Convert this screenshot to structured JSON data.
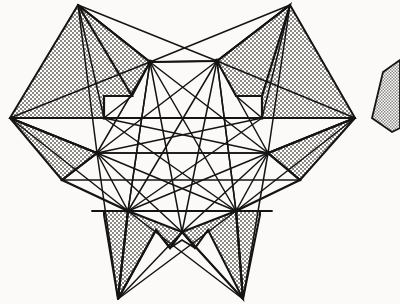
{
  "figure": {
    "title": "Stippled star polygon with interior line lattice",
    "type": "line-diagram",
    "width": 400,
    "height": 304,
    "background_color": "#fbfaf8",
    "stroke_color": "#141414",
    "fill_pattern": "stipple-gray",
    "fill_color": "#b8b5b0",
    "stroke_width": 1.6,
    "outline_stroke_width": 2.2
  },
  "star": {
    "name": "six-lobed stipple star",
    "points_count": 6,
    "outer_tips": [
      {
        "name": "tip-top-left",
        "x": 78,
        "y": 5
      },
      {
        "name": "tip-top-right",
        "x": 290,
        "y": 5
      },
      {
        "name": "tip-left",
        "x": 10,
        "y": 118
      },
      {
        "name": "tip-right",
        "x": 355,
        "y": 118
      },
      {
        "name": "tip-bottom-left",
        "x": 118,
        "y": 299
      },
      {
        "name": "tip-bottom-right",
        "x": 243,
        "y": 299
      }
    ],
    "outline_path": "M 78,5 L 150,62 L 217,61 L 290,5 L 268,96 L 355,118 L 262,140 L 300,180 L 236,211 L 243,299 L 182,232 L 170,248 L 156,230 L 118,299 L 128,211 L 62,180 L 97,153 L 10,118 L 104,118 L 104,96 L 132,96 Z"
  },
  "lattice": {
    "name": "interior line network",
    "hub_nodes": [
      {
        "id": "A",
        "x": 150,
        "y": 62
      },
      {
        "id": "B",
        "x": 217,
        "y": 61
      },
      {
        "id": "C",
        "x": 97,
        "y": 153
      },
      {
        "id": "D",
        "x": 268,
        "y": 153
      },
      {
        "id": "E",
        "x": 128,
        "y": 211
      },
      {
        "id": "F",
        "x": 236,
        "y": 211
      }
    ],
    "rail_nodes": [
      {
        "id": "G",
        "x": 104,
        "y": 118
      },
      {
        "id": "H",
        "x": 262,
        "y": 118
      },
      {
        "id": "I",
        "x": 182,
        "y": 232
      },
      {
        "id": "J",
        "x": 170,
        "y": 118
      },
      {
        "id": "K",
        "x": 183,
        "y": 153
      }
    ],
    "horizontal_rails": [
      {
        "name": "rail-upper",
        "y": 118,
        "x1": 10,
        "x2": 355
      },
      {
        "name": "rail-middle",
        "y": 153,
        "x1": 62,
        "x2": 300
      },
      {
        "name": "rail-lower",
        "y": 211,
        "x1": 92,
        "x2": 272
      }
    ],
    "edges": [
      [
        "A",
        "B"
      ],
      [
        "A",
        "C"
      ],
      [
        "A",
        "D"
      ],
      [
        "A",
        "E"
      ],
      [
        "A",
        "F"
      ],
      [
        "B",
        "C"
      ],
      [
        "B",
        "D"
      ],
      [
        "B",
        "E"
      ],
      [
        "B",
        "F"
      ],
      [
        "C",
        "D"
      ],
      [
        "C",
        "E"
      ],
      [
        "C",
        "F"
      ],
      [
        "D",
        "E"
      ],
      [
        "D",
        "F"
      ],
      [
        "E",
        "F"
      ]
    ],
    "tip_spokes": [
      [
        "tip-top-left",
        "A"
      ],
      [
        "tip-top-left",
        "B"
      ],
      [
        "tip-top-left",
        "C"
      ],
      [
        "tip-top-right",
        "A"
      ],
      [
        "tip-top-right",
        "B"
      ],
      [
        "tip-top-right",
        "D"
      ],
      [
        "tip-left",
        "C"
      ],
      [
        "tip-left",
        "A"
      ],
      [
        "tip-left",
        "E"
      ],
      [
        "tip-right",
        "D"
      ],
      [
        "tip-right",
        "B"
      ],
      [
        "tip-right",
        "F"
      ],
      [
        "tip-bottom-left",
        "E"
      ],
      [
        "tip-bottom-left",
        "C"
      ],
      [
        "tip-bottom-left",
        "F"
      ],
      [
        "tip-bottom-right",
        "F"
      ],
      [
        "tip-bottom-right",
        "D"
      ],
      [
        "tip-bottom-right",
        "E"
      ]
    ]
  },
  "edge_fragment": {
    "name": "clipped neighbour star fragment",
    "description": "partial stippled wedge cropped at right edge",
    "path": "M 400,60 L 383,72 L 372,118 L 390,131 L 400,126 Z"
  }
}
